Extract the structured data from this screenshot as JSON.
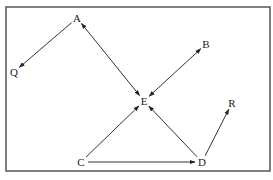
{
  "diagram": {
    "type": "directed-graph",
    "frame": {
      "x": 6,
      "y": 7,
      "width": 264,
      "height": 164,
      "stroke": "#555555"
    },
    "edge_color": "#333333",
    "nodes": [
      {
        "id": "A",
        "label": "A",
        "x": 77,
        "y": 18
      },
      {
        "id": "Q",
        "label": "Q",
        "x": 14,
        "y": 72
      },
      {
        "id": "B",
        "label": "B",
        "x": 206,
        "y": 44
      },
      {
        "id": "E",
        "label": "E",
        "x": 144,
        "y": 101
      },
      {
        "id": "R",
        "label": "R",
        "x": 232,
        "y": 103
      },
      {
        "id": "C",
        "label": "C",
        "x": 81,
        "y": 162
      },
      {
        "id": "D",
        "label": "D",
        "x": 202,
        "y": 162
      }
    ],
    "edges": [
      {
        "from": "A",
        "to": "Q",
        "bidirectional": false
      },
      {
        "from": "A",
        "to": "E",
        "bidirectional": true
      },
      {
        "from": "B",
        "to": "E",
        "bidirectional": true
      },
      {
        "from": "C",
        "to": "E",
        "bidirectional": false
      },
      {
        "from": "C",
        "to": "D",
        "bidirectional": false
      },
      {
        "from": "D",
        "to": "E",
        "bidirectional": false
      },
      {
        "from": "D",
        "to": "R",
        "bidirectional": false
      }
    ]
  }
}
